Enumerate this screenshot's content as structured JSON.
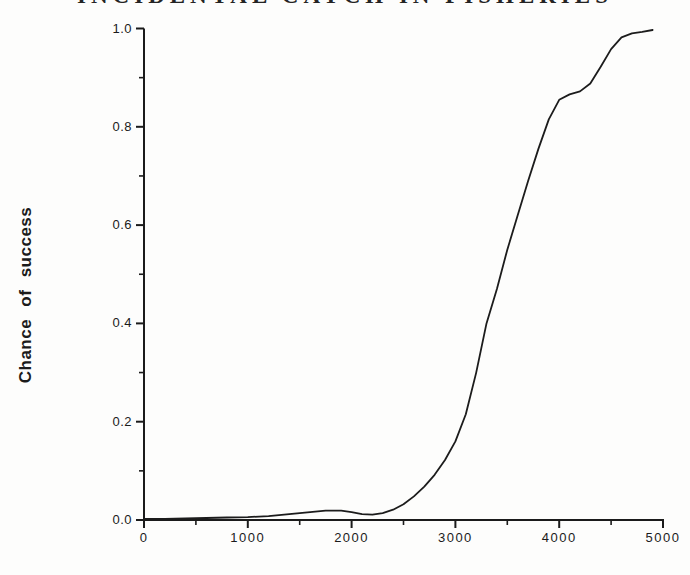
{
  "title": "INCIDENTAL CATCH IN FISHERIES",
  "chart_data": {
    "type": "line",
    "title": "INCIDENTAL CATCH IN FISHERIES",
    "xlabel": "",
    "ylabel": "Chance of success",
    "xlim": [
      0,
      5000
    ],
    "ylim": [
      0.0,
      1.0
    ],
    "grid": false,
    "legend": false,
    "line_color": "#1c1c1c",
    "axis_color": "#1b1b1b",
    "background_color": "#fdfdfc",
    "x_major_ticks": [
      0,
      1000,
      2000,
      3000,
      4000,
      5000
    ],
    "x_major_tick_labels": [
      "0",
      "1000",
      "2000",
      "3000",
      "4000",
      "5000"
    ],
    "x_minor_ticks": [
      500,
      1500,
      2500,
      3500,
      4500
    ],
    "y_major_ticks": [
      0.0,
      0.2,
      0.4,
      0.6,
      0.8,
      1.0
    ],
    "y_major_tick_labels": [
      "0.0",
      "0.2",
      "0.4",
      "0.6",
      "0.8",
      "1.0"
    ],
    "y_minor_ticks": [
      0.1,
      0.3,
      0.5,
      0.7,
      0.9
    ],
    "series": [
      {
        "name": "chance-of-success",
        "x": [
          0,
          200,
          400,
          600,
          800,
          1000,
          1200,
          1400,
          1600,
          1750,
          1900,
          2000,
          2100,
          2200,
          2300,
          2400,
          2500,
          2600,
          2700,
          2800,
          2900,
          3000,
          3100,
          3200,
          3300,
          3400,
          3500,
          3600,
          3700,
          3800,
          3900,
          4000,
          4100,
          4200,
          4300,
          4400,
          4500,
          4600,
          4700,
          4800,
          4900
        ],
        "y": [
          0.002,
          0.002,
          0.003,
          0.004,
          0.005,
          0.006,
          0.008,
          0.012,
          0.016,
          0.019,
          0.019,
          0.016,
          0.012,
          0.011,
          0.014,
          0.021,
          0.032,
          0.048,
          0.068,
          0.092,
          0.122,
          0.16,
          0.215,
          0.3,
          0.4,
          0.47,
          0.55,
          0.62,
          0.69,
          0.755,
          0.815,
          0.855,
          0.866,
          0.872,
          0.888,
          0.922,
          0.958,
          0.982,
          0.99,
          0.993,
          0.997
        ]
      }
    ]
  }
}
